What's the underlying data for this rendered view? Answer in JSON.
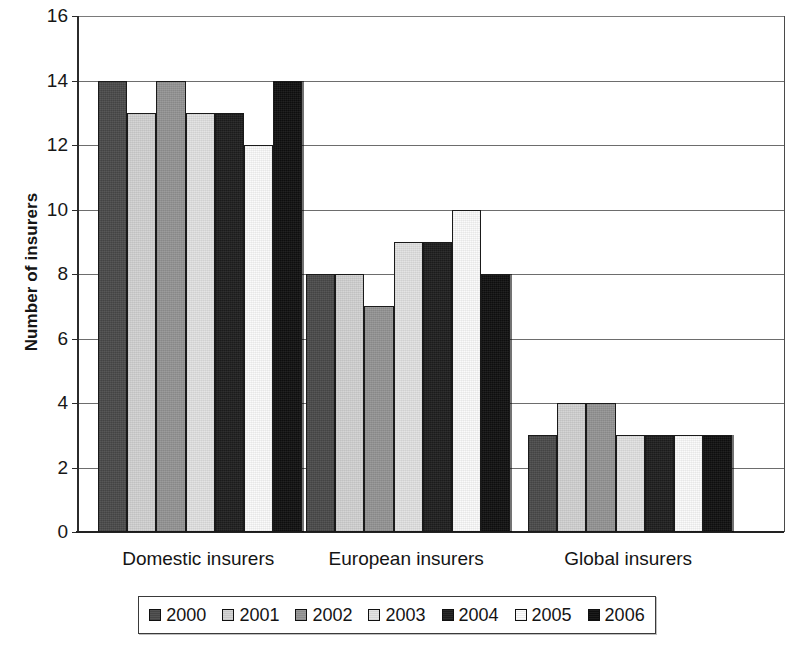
{
  "chart_data": {
    "type": "bar",
    "title": "",
    "subtitle": "",
    "xlabel": "",
    "ylabel": "Number of insurers",
    "ylim": [
      0,
      16
    ],
    "ytick_step": 2,
    "yticks": [
      0,
      2,
      4,
      6,
      8,
      10,
      12,
      14,
      16
    ],
    "ytick_labels": [
      "0",
      "2",
      "4",
      "6",
      "8",
      "10",
      "12",
      "14",
      "16"
    ],
    "grid": true,
    "grid_axis": "y",
    "legend_position": "bottom",
    "categories": [
      "Domestic insurers",
      "European insurers",
      "Global insurers"
    ],
    "series": [
      {
        "name": "2000",
        "color": "#4a4a4a",
        "values": [
          14,
          8,
          3
        ]
      },
      {
        "name": "2001",
        "color": "#d2d2d2",
        "values": [
          13,
          8,
          4
        ]
      },
      {
        "name": "2002",
        "color": "#949494",
        "values": [
          14,
          7,
          4
        ]
      },
      {
        "name": "2003",
        "color": "#e2e2e2",
        "values": [
          13,
          9,
          3
        ]
      },
      {
        "name": "2004",
        "color": "#1e1e1e",
        "values": [
          13,
          9,
          3
        ]
      },
      {
        "name": "2005",
        "color": "#fbfbfb",
        "values": [
          12,
          10,
          3
        ]
      },
      {
        "name": "2006",
        "color": "#0f0f0f",
        "values": [
          14,
          8,
          3
        ]
      }
    ]
  },
  "axis": {
    "y_title": "Number of insurers"
  },
  "legend": {
    "items": [
      {
        "label": "2000",
        "color": "#4a4a4a"
      },
      {
        "label": "2001",
        "color": "#d2d2d2"
      },
      {
        "label": "2002",
        "color": "#949494"
      },
      {
        "label": "2003",
        "color": "#e2e2e2"
      },
      {
        "label": "2004",
        "color": "#1e1e1e"
      },
      {
        "label": "2005",
        "color": "#fbfbfb"
      },
      {
        "label": "2006",
        "color": "#0f0f0f"
      }
    ]
  }
}
